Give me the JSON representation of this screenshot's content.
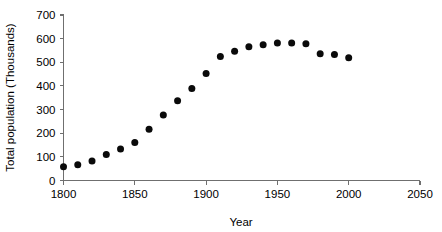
{
  "chart_data": {
    "type": "scatter",
    "title": "",
    "xlabel": "Year",
    "ylabel": "Total population (Thousands)",
    "xlim": [
      1800,
      2050
    ],
    "ylim": [
      0,
      700
    ],
    "xticks": [
      1800,
      1850,
      1900,
      1950,
      2000,
      2050
    ],
    "yticks": [
      0,
      100,
      200,
      300,
      400,
      500,
      600,
      700
    ],
    "xtick_labels": [
      "1800",
      "1850",
      "1900",
      "1950",
      "2000",
      "2050"
    ],
    "ytick_labels": [
      "0",
      "100",
      "200",
      "300",
      "400",
      "500",
      "600",
      "700"
    ],
    "grid": false,
    "legend": false,
    "marker": "filled-circle",
    "marker_color": "#0a0a0a",
    "marker_size_px": 7,
    "x": [
      1800,
      1810,
      1820,
      1830,
      1840,
      1850,
      1860,
      1870,
      1880,
      1890,
      1900,
      1910,
      1920,
      1930,
      1940,
      1950,
      1960,
      1970,
      1980,
      1990,
      2000
    ],
    "y": [
      58,
      67,
      82,
      110,
      133,
      161,
      217,
      277,
      337,
      389,
      453,
      525,
      547,
      566,
      574,
      582,
      582,
      578,
      536,
      533,
      519
    ],
    "series": [
      {
        "name": "Total population",
        "x": [
          1800,
          1810,
          1820,
          1830,
          1840,
          1850,
          1860,
          1870,
          1880,
          1890,
          1900,
          1910,
          1920,
          1930,
          1940,
          1950,
          1960,
          1970,
          1980,
          1990,
          2000
        ],
        "values": [
          58,
          67,
          82,
          110,
          133,
          161,
          217,
          277,
          337,
          389,
          453,
          525,
          547,
          566,
          574,
          582,
          582,
          578,
          536,
          533,
          519
        ]
      }
    ]
  },
  "axes": {
    "x_title": "Year",
    "y_title": "Total population (Thousands)"
  }
}
